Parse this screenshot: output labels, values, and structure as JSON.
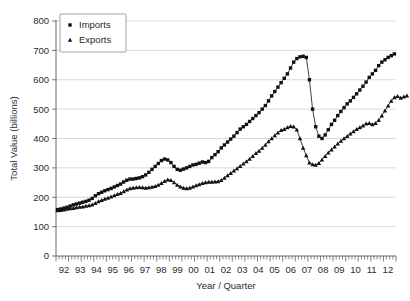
{
  "chart_data": {
    "type": "line",
    "title": "",
    "xlabel": "Year / Quarter",
    "ylabel": "Total Value (billions)",
    "ylim": [
      0,
      800
    ],
    "yticks": [
      0,
      100,
      200,
      300,
      400,
      500,
      600,
      700,
      800
    ],
    "ytick_labels": [
      "0",
      "100",
      "200",
      "300",
      "400",
      "500",
      "600",
      "700",
      "800"
    ],
    "grid": "horizontal",
    "legend_position": "upper-left-inside",
    "x_tick_labels": [
      "92",
      "93",
      "94",
      "95",
      "96",
      "97",
      "98",
      "99",
      "00",
      "01",
      "02",
      "03",
      "04",
      "05",
      "06",
      "07",
      "08",
      "09",
      "10",
      "11",
      "12"
    ],
    "x_minor_ticks_per_year": 4,
    "x_unit": "quarter",
    "x_start_year": 1992,
    "x_end_year": 2012,
    "legend": [
      {
        "name": "Imports",
        "marker": "square"
      },
      {
        "name": "Exports",
        "marker": "triangle"
      }
    ],
    "series": [
      {
        "name": "Imports",
        "marker": "square",
        "color": "#111111",
        "values": [
          158,
          160,
          163,
          166,
          170,
          174,
          177,
          180,
          183,
          186,
          190,
          196,
          205,
          212,
          217,
          222,
          226,
          230,
          235,
          240,
          245,
          252,
          258,
          262,
          262,
          264,
          266,
          270,
          276,
          285,
          295,
          305,
          315,
          325,
          330,
          327,
          318,
          305,
          295,
          292,
          296,
          300,
          305,
          310,
          312,
          316,
          320,
          318,
          322,
          335,
          345,
          355,
          368,
          378,
          388,
          398,
          408,
          420,
          432,
          440,
          448,
          458,
          468,
          478,
          488,
          500,
          512,
          528,
          545,
          560,
          575,
          590,
          605,
          620,
          640,
          660,
          672,
          678,
          680,
          676,
          600,
          500,
          440,
          408,
          400,
          412,
          430,
          448,
          462,
          478,
          492,
          505,
          518,
          528,
          540,
          552,
          565,
          578,
          592,
          608,
          620,
          632,
          648,
          660,
          668,
          676,
          682,
          688
        ]
      },
      {
        "name": "Exports",
        "marker": "triangle",
        "color": "#111111",
        "values": [
          155,
          156,
          158,
          160,
          162,
          163,
          165,
          167,
          168,
          170,
          172,
          175,
          180,
          186,
          190,
          194,
          198,
          202,
          206,
          210,
          214,
          220,
          226,
          230,
          232,
          233,
          234,
          233,
          232,
          233,
          235,
          238,
          242,
          248,
          255,
          260,
          258,
          250,
          242,
          236,
          232,
          230,
          232,
          236,
          240,
          244,
          248,
          250,
          252,
          252,
          253,
          254,
          258,
          266,
          274,
          282,
          290,
          298,
          306,
          314,
          322,
          330,
          340,
          350,
          358,
          368,
          378,
          390,
          400,
          410,
          420,
          428,
          432,
          438,
          442,
          440,
          430,
          400,
          368,
          342,
          318,
          312,
          310,
          316,
          328,
          340,
          352,
          362,
          372,
          382,
          392,
          400,
          408,
          416,
          424,
          432,
          438,
          444,
          450,
          452,
          448,
          452,
          462,
          478,
          495,
          512,
          528,
          540,
          544,
          538,
          542,
          546
        ]
      }
    ]
  }
}
